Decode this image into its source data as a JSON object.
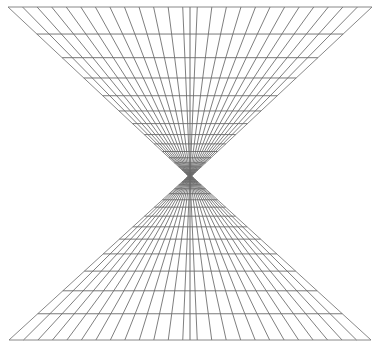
{
  "figure": {
    "type": "line-drawing",
    "background_color": "#ffffff",
    "line_color": "#6e6e6e",
    "line_width_px": 0.9,
    "canvas": {
      "width": 380,
      "height": 348
    }
  },
  "chart_data": {
    "type": "line",
    "subtitle": "Two mirrored one-point-perspective grids meeting at a central vanishing waist",
    "xlabel": "",
    "ylabel": "",
    "grid": true,
    "legend": false,
    "axis_ranges": {
      "x": [
        0,
        380
      ],
      "y": [
        0,
        348
      ]
    },
    "geometry": {
      "vanishing_point": {
        "x": 190,
        "y": 176
      },
      "waist_y": 176,
      "waist_half_width": 1.5,
      "top_edge_y": 7,
      "bottom_edge_y": 340,
      "top_left_x": 8,
      "top_right_x": 372,
      "bottom_left_x": 9,
      "bottom_right_x": 371,
      "radial_line_count_per_half": 25,
      "horizontal_line_count_per_half": 16,
      "center_axis_x": 190,
      "symmetry": "mirrored about horizontal waist line"
    },
    "radial_offsets": [
      -1.0,
      -0.92,
      -0.84,
      -0.76,
      -0.68,
      -0.6,
      -0.52,
      -0.44,
      -0.36,
      -0.28,
      -0.2,
      -0.12,
      -0.04,
      0.04,
      0.12,
      0.2,
      0.28,
      0.36,
      0.44,
      0.52,
      0.6,
      0.68,
      0.76,
      0.84,
      0.92,
      1.0
    ],
    "horizontal_depths": [
      1.0,
      0.84,
      0.7,
      0.58,
      0.475,
      0.385,
      0.31,
      0.245,
      0.19,
      0.145,
      0.108,
      0.078,
      0.054,
      0.036,
      0.022,
      0.012,
      0.005
    ],
    "series": [
      {
        "name": "radial lines (upper cone)",
        "values": []
      },
      {
        "name": "radial lines (lower cone)",
        "values": []
      },
      {
        "name": "horizontal rulings (upper cone)",
        "values": []
      },
      {
        "name": "horizontal rulings (lower cone)",
        "values": []
      }
    ]
  }
}
